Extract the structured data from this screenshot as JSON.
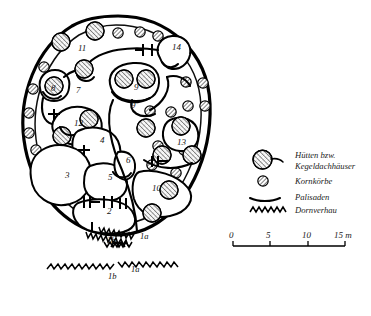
{
  "figure": {
    "kind": "archaeological-site-plan",
    "background_color": "#ffffff",
    "ink_color": "#000000"
  },
  "map": {
    "name": "fortified-settlement-plan",
    "enclosure": {
      "name": "outer-palisade-ring",
      "description": "thick closed outer palisade enclosing the settlement"
    },
    "labels": [
      {
        "id": "l-11",
        "text": "11",
        "x": 78,
        "y": 51,
        "kind": "compound-number"
      },
      {
        "id": "l-14",
        "text": "14",
        "x": 172,
        "y": 50,
        "kind": "compound-number"
      },
      {
        "id": "l-8",
        "text": "8",
        "x": 51,
        "y": 91,
        "kind": "compound-number"
      },
      {
        "id": "l-7",
        "text": "7",
        "x": 76,
        "y": 93,
        "kind": "compound-number"
      },
      {
        "id": "l-9a",
        "text": "9",
        "x": 134,
        "y": 90,
        "kind": "compound-number"
      },
      {
        "id": "l-9b",
        "text": "9",
        "x": 131,
        "y": 108,
        "kind": "compound-number"
      },
      {
        "id": "l-12",
        "text": "12",
        "x": 74,
        "y": 126,
        "kind": "compound-number"
      },
      {
        "id": "l-4",
        "text": "4",
        "x": 100,
        "y": 143,
        "kind": "compound-number"
      },
      {
        "id": "l-13",
        "text": "13",
        "x": 177,
        "y": 145,
        "kind": "compound-number"
      },
      {
        "id": "l-3",
        "text": "3",
        "x": 65,
        "y": 178,
        "kind": "compound-number"
      },
      {
        "id": "l-5",
        "text": "5",
        "x": 108,
        "y": 180,
        "kind": "compound-number"
      },
      {
        "id": "l-6",
        "text": "6",
        "x": 126,
        "y": 163,
        "kind": "compound-number"
      },
      {
        "id": "l-10",
        "text": "10",
        "x": 152,
        "y": 191,
        "kind": "compound-number"
      },
      {
        "id": "l-2",
        "text": "2",
        "x": 107,
        "y": 214,
        "kind": "compound-number"
      },
      {
        "id": "l-1a",
        "text": "1a",
        "x": 140,
        "y": 239,
        "kind": "barrier-number"
      },
      {
        "id": "l-1b",
        "text": "1b",
        "x": 107,
        "y": 243,
        "kind": "barrier-number"
      },
      {
        "id": "l-1a2",
        "text": "1a",
        "x": 131,
        "y": 272,
        "kind": "barrier-number"
      },
      {
        "id": "l-1b2",
        "text": "1b",
        "x": 108,
        "y": 279,
        "kind": "barrier-number"
      }
    ]
  },
  "legend": {
    "name": "map-legend",
    "items": [
      {
        "symbol": "large-hatched-circle",
        "label_line1": "Hütten bzw.",
        "label_line2": "Kegeldachhäuser"
      },
      {
        "symbol": "small-hatched-circle",
        "label_line1": "Kornkörbe",
        "label_line2": ""
      },
      {
        "symbol": "curved-line",
        "label_line1": "Palisaden",
        "label_line2": ""
      },
      {
        "symbol": "zigzag-line",
        "label_line1": "Dornverhau",
        "label_line2": ""
      }
    ]
  },
  "scale": {
    "name": "scale-bar",
    "ticks": [
      "0",
      "5",
      "10",
      "15"
    ],
    "unit": "m",
    "last_tick_with_unit": "15 m"
  }
}
